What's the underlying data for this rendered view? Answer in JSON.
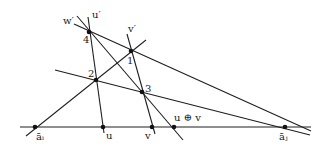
{
  "diagram": {
    "type": "projective-construction",
    "points": [
      {
        "id": "a_i",
        "label": "āᵢ",
        "role": "baseline point"
      },
      {
        "id": "u",
        "label": "u",
        "role": "baseline point"
      },
      {
        "id": "v",
        "label": "v",
        "role": "baseline point"
      },
      {
        "id": "uv_sum",
        "label": "u ⊕ v",
        "role": "baseline point"
      },
      {
        "id": "a_j",
        "label": "āⱼ",
        "role": "baseline point"
      },
      {
        "id": "p1",
        "label": "1",
        "role": "intersection"
      },
      {
        "id": "p2",
        "label": "2",
        "role": "intersection"
      },
      {
        "id": "p3",
        "label": "3",
        "role": "intersection"
      },
      {
        "id": "p4",
        "label": "4",
        "role": "intersection"
      }
    ],
    "line_labels": {
      "w_prime": "w′",
      "u_prime": "u′",
      "v_prime": "v′"
    },
    "lines": [
      {
        "name": "baseline",
        "through": [
          "a_i",
          "u",
          "v",
          "uv_sum",
          "a_j"
        ]
      },
      {
        "name": "line-u-prime",
        "through": [
          "p4",
          "p2",
          "u"
        ]
      },
      {
        "name": "line-v-prime",
        "through": [
          "p1",
          "p3",
          "v"
        ]
      },
      {
        "name": "line-w-prime",
        "through": [
          "p4",
          "p1",
          "a_j"
        ]
      },
      {
        "name": "line-a_i",
        "through": [
          "a_i",
          "p2",
          "p1"
        ]
      },
      {
        "name": "line-2-3",
        "through": [
          "p2",
          "p3",
          "a_j"
        ]
      },
      {
        "name": "line-4-3",
        "through": [
          "p4",
          "p3",
          "uv_sum"
        ]
      }
    ]
  }
}
